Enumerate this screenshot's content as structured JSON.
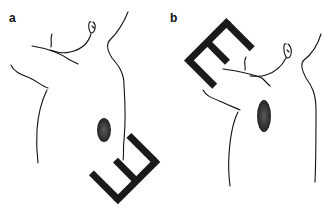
{
  "panels": [
    {
      "label": "a",
      "description": "Torso side view with electrode device at lower back"
    },
    {
      "label": "b",
      "description": "Torso side view with electrode device at upper back"
    }
  ],
  "colors": {
    "line": "#111111",
    "device": "#1a1a1a",
    "oval": "#3a3a3a"
  }
}
